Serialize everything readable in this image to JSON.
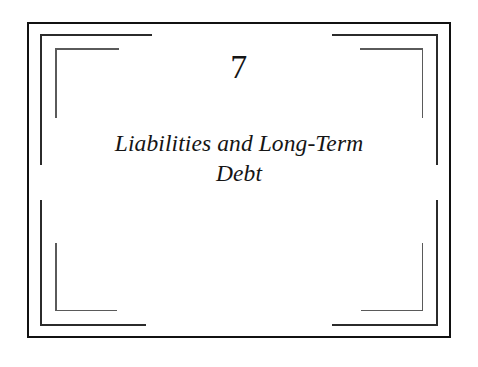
{
  "page": {
    "kind": "book-chapter-title-page",
    "background_color": "#ffffff",
    "width": 478,
    "height": 367
  },
  "chapter": {
    "number": "7",
    "title_line_1": "Liabilities and Long-Term",
    "title_line_2": "Debt",
    "title_full": "Liabilities and Long-Term Debt"
  },
  "frame": {
    "ink_color": "#2b2b2b",
    "outer_rule_color": "#111111",
    "inner_rule_color": "#5a5a5a",
    "layers": 3
  }
}
